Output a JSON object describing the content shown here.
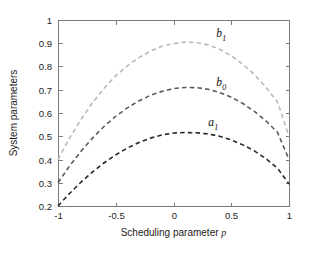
{
  "chart_data": {
    "type": "line",
    "title": "",
    "xlabel": "Scheduling parameter p",
    "ylabel": "System parameters",
    "xlim": [
      -1,
      1
    ],
    "ylim": [
      0.2,
      1
    ],
    "grid": false,
    "legend": "inline-curve-labels",
    "xticks": [
      -1,
      -0.5,
      0,
      0.5,
      1
    ],
    "xticklabels": [
      "-1",
      "-0.5",
      "0",
      "0.5",
      "1"
    ],
    "yticks": [
      0.2,
      0.3,
      0.4,
      0.5,
      0.6,
      0.7,
      0.8,
      0.9,
      1
    ],
    "yticklabels": [
      "0.2",
      "0.3",
      "0.4",
      "0.5",
      "0.6",
      "0.7",
      "0.8",
      "0.9",
      "1"
    ],
    "x": [
      -1,
      -0.9,
      -0.8,
      -0.7,
      -0.6,
      -0.5,
      -0.4,
      -0.3,
      -0.2,
      -0.1,
      0,
      0.1,
      0.2,
      0.3,
      0.4,
      0.5,
      0.6,
      0.7,
      0.8,
      0.9,
      1
    ],
    "series": [
      {
        "name": "b_1",
        "label_base": "b",
        "label_sub": "1",
        "color": "#b9b9b9",
        "style": "dashed",
        "label_x": 0.37,
        "label_y": 0.925,
        "values": [
          0.4,
          0.492,
          0.573,
          0.645,
          0.707,
          0.76,
          0.803,
          0.838,
          0.866,
          0.887,
          0.899,
          0.905,
          0.903,
          0.893,
          0.874,
          0.846,
          0.81,
          0.765,
          0.711,
          0.648,
          0.5
        ]
      },
      {
        "name": "b_0",
        "label_base": "b",
        "label_sub": "0",
        "color": "#5a5a5a",
        "style": "dashed",
        "label_x": 0.37,
        "label_y": 0.718,
        "values": [
          0.3,
          0.372,
          0.436,
          0.493,
          0.543,
          0.586,
          0.622,
          0.652,
          0.676,
          0.693,
          0.705,
          0.71,
          0.709,
          0.702,
          0.688,
          0.668,
          0.641,
          0.607,
          0.566,
          0.517,
          0.4
        ]
      },
      {
        "name": "a_1",
        "label_base": "a",
        "label_sub": "1",
        "color": "#262626",
        "style": "dashed",
        "label_x": 0.3,
        "label_y": 0.545,
        "values": [
          0.2,
          0.254,
          0.303,
          0.347,
          0.386,
          0.42,
          0.449,
          0.473,
          0.492,
          0.506,
          0.514,
          0.516,
          0.515,
          0.51,
          0.5,
          0.484,
          0.463,
          0.437,
          0.404,
          0.363,
          0.295
        ]
      }
    ],
    "axes_box": {
      "left": 58,
      "right": 289,
      "top": 20,
      "bottom": 206
    }
  }
}
